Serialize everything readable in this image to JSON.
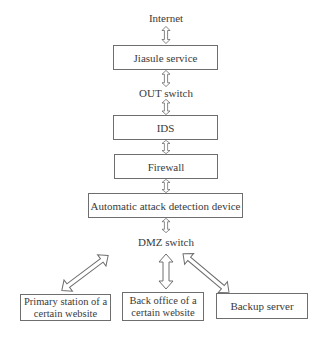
{
  "diagram": {
    "type": "network-architecture-flow",
    "nodes": {
      "internet": {
        "label": "Internet"
      },
      "jiasule": {
        "label": "Jiasule service"
      },
      "out_switch": {
        "label": "OUT switch"
      },
      "ids": {
        "label": "IDS"
      },
      "firewall": {
        "label": "Firewall"
      },
      "attack_detection": {
        "label": "Automatic attack detection device"
      },
      "dmz_switch": {
        "label": "DMZ switch"
      },
      "primary_station": {
        "line1": "Primary station of a",
        "line2": "certain website"
      },
      "back_office": {
        "line1": "Back office of a",
        "line2": "certain website"
      },
      "backup_server": {
        "label": "Backup server"
      }
    },
    "edges": [
      {
        "from": "Internet",
        "to": "Jiasule service",
        "style": "double-arrow"
      },
      {
        "from": "Jiasule service",
        "to": "OUT switch",
        "style": "double-arrow"
      },
      {
        "from": "OUT switch",
        "to": "IDS",
        "style": "double-arrow"
      },
      {
        "from": "IDS",
        "to": "Firewall",
        "style": "double-arrow"
      },
      {
        "from": "Firewall",
        "to": "Automatic attack detection device",
        "style": "double-arrow"
      },
      {
        "from": "Automatic attack detection device",
        "to": "DMZ switch",
        "style": "double-arrow"
      },
      {
        "from": "DMZ switch",
        "to": "Primary station of a certain website",
        "style": "double-arrow"
      },
      {
        "from": "DMZ switch",
        "to": "Back office of a certain website",
        "style": "double-arrow"
      },
      {
        "from": "DMZ switch",
        "to": "Backup server",
        "style": "double-arrow"
      }
    ],
    "colors": {
      "stroke": "#6e6e6e",
      "text": "#3a3a3a",
      "background": "#ffffff"
    }
  }
}
